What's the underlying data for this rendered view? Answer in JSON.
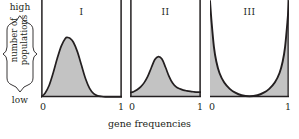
{
  "figure": {
    "x_axis_label": "gene frequencies",
    "y_axis_label_line1": "number of",
    "y_axis_label_line2": "populations",
    "y_axis_high": "high",
    "y_axis_low": "low",
    "ink_color": "#231f20",
    "fill_color": "#c3c3c3",
    "background_color": "#ffffff"
  },
  "chart_data": [
    {
      "type": "area",
      "title": "I",
      "xlabel": "gene frequencies",
      "ylabel": "number of populations",
      "xlim": [
        0,
        1
      ],
      "ylim": [
        0,
        1
      ],
      "xticks": [
        0,
        1
      ],
      "xticklabels": [
        "0",
        "1"
      ],
      "yticklabels": [
        "low",
        "high"
      ],
      "grid": false,
      "legend": "none",
      "description": "Narrow right-skewed unimodal distribution peaking near a gene frequency of 0.33; curve returns to zero before 0.7 and stays at zero thereafter.",
      "x": [
        0.0,
        0.05,
        0.1,
        0.15,
        0.2,
        0.25,
        0.3,
        0.33,
        0.36,
        0.4,
        0.45,
        0.5,
        0.55,
        0.6,
        0.65,
        0.7,
        0.75,
        0.8,
        0.85,
        0.9,
        0.95,
        1.0
      ],
      "y": [
        0.0,
        0.04,
        0.12,
        0.25,
        0.4,
        0.53,
        0.61,
        0.62,
        0.61,
        0.57,
        0.47,
        0.33,
        0.19,
        0.09,
        0.035,
        0.012,
        0.005,
        0.002,
        0.001,
        0.0,
        0.0,
        0.0
      ]
    },
    {
      "type": "area",
      "title": "II",
      "xlabel": "gene frequencies",
      "ylabel": "number of populations",
      "xlim": [
        0,
        1
      ],
      "ylim": [
        0,
        1
      ],
      "xticks": [
        0,
        1
      ],
      "xticklabels": [
        "0",
        "1"
      ],
      "yticklabels": [
        "low",
        "high"
      ],
      "grid": false,
      "legend": "none",
      "description": "Broader, lower unimodal peak near a gene frequency of 0.40 with a small non-zero plateau extending across the right half of the range.",
      "x": [
        0.0,
        0.05,
        0.1,
        0.15,
        0.2,
        0.25,
        0.3,
        0.35,
        0.4,
        0.45,
        0.5,
        0.55,
        0.6,
        0.65,
        0.7,
        0.75,
        0.8,
        0.85,
        0.9,
        0.95,
        1.0
      ],
      "y": [
        0.045,
        0.055,
        0.075,
        0.105,
        0.15,
        0.215,
        0.305,
        0.39,
        0.42,
        0.395,
        0.31,
        0.215,
        0.145,
        0.105,
        0.085,
        0.072,
        0.064,
        0.058,
        0.054,
        0.051,
        0.05
      ]
    },
    {
      "type": "area",
      "title": "III",
      "xlabel": "gene frequencies",
      "ylabel": "number of populations",
      "xlim": [
        0,
        1
      ],
      "ylim": [
        0,
        1
      ],
      "xticks": [
        0,
        1
      ],
      "xticklabels": [
        "0",
        "1"
      ],
      "yticklabels": [
        "low",
        "high"
      ],
      "grid": false,
      "legend": "none",
      "description": "Symmetric U-shaped distribution: populations pile up at gene frequencies of 0 and 1 where the curve rises to the top of the panel, with a minimum near zero at a frequency of 0.5. Shading lies outside (below) the U.",
      "x": [
        0.0,
        0.02,
        0.05,
        0.08,
        0.12,
        0.18,
        0.25,
        0.32,
        0.4,
        0.5,
        0.6,
        0.68,
        0.75,
        0.82,
        0.88,
        0.92,
        0.95,
        0.98,
        1.0
      ],
      "y": [
        1.0,
        0.78,
        0.52,
        0.37,
        0.25,
        0.15,
        0.085,
        0.045,
        0.018,
        0.008,
        0.018,
        0.045,
        0.085,
        0.15,
        0.25,
        0.37,
        0.52,
        0.78,
        1.0
      ]
    }
  ],
  "panels": [
    {
      "label": "I",
      "tick_left": "0",
      "tick_right": "1"
    },
    {
      "label": "II",
      "tick_left": "0",
      "tick_right": "1"
    },
    {
      "label": "III",
      "tick_left": "0",
      "tick_right": "1"
    }
  ]
}
